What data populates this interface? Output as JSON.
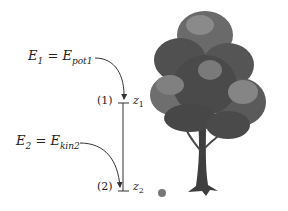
{
  "equations": [
    {
      "lhs": "E",
      "lhs_sub": "1",
      "rhs": "E",
      "rhs_sub": "pot1"
    },
    {
      "lhs": "E",
      "lhs_sub": "2",
      "rhs": "E",
      "rhs_sub": "kin2"
    }
  ],
  "points": [
    {
      "index": "(1)",
      "height": "z",
      "height_sub": "1"
    },
    {
      "index": "(2)",
      "height": "z",
      "height_sub": "2"
    }
  ],
  "colors": {
    "ink": "#333333",
    "ball": "#777777",
    "foliage_dark": "#4a4a4a",
    "foliage_mid": "#6a6a6a",
    "foliage_light": "#8a8a8a",
    "trunk": "#3e3e3e"
  }
}
